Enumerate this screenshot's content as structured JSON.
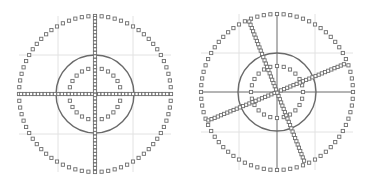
{
  "figure": {
    "colors": {
      "background": "#ffffff",
      "grid": "#e2e2e2",
      "solid_line": "#6a6a6a",
      "marker_stroke": "#6e6e6e",
      "marker_fill": "#ffffff"
    },
    "panels": [
      {
        "id": "left",
        "center": [
          95,
          94
        ],
        "outer_marker_circle": {
          "rx": 76,
          "ry": 78,
          "count": 72
        },
        "solid_circle": {
          "r": 39
        },
        "inner_marker_circle": {
          "r": 26,
          "count": 24
        },
        "grid_x": [
          58,
          133
        ],
        "grid_y": [
          55,
          134
        ],
        "solid_cross": false,
        "marker_cross_angle_deg": 0
      },
      {
        "id": "right",
        "center": [
          277,
          92
        ],
        "outer_marker_circle": {
          "rx": 76,
          "ry": 78,
          "count": 72
        },
        "solid_circle": {
          "r": 39
        },
        "inner_marker_circle": {
          "r": 26,
          "count": 24
        },
        "grid_x": [
          239,
          315
        ],
        "grid_y": [
          53,
          132
        ],
        "solid_cross": true,
        "marker_cross_angle_deg": -22
      }
    ]
  }
}
